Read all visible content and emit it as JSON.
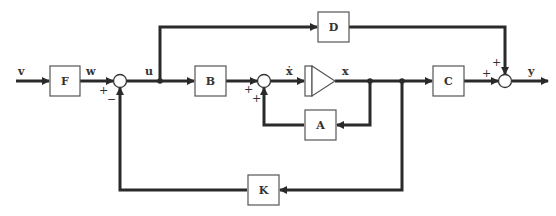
{
  "diagram": {
    "type": "control-system-block-diagram",
    "blocks": {
      "F": "F",
      "B": "B",
      "A": "A",
      "C": "C",
      "D": "D",
      "K": "K"
    },
    "signals": {
      "v": "v",
      "w": "w",
      "u": "u",
      "xdot": "ẋ",
      "x": "x",
      "y": "y"
    },
    "sum1_signs": {
      "w_in": "+",
      "feedback_in": "−"
    },
    "sum2_signs": {
      "b_in": "+",
      "a_in": "+"
    },
    "sum3_signs": {
      "c_in": "+",
      "d_in": "+"
    },
    "integrator": "integrator",
    "colors": {
      "line": "#2a2a2a",
      "block_border": "#555555",
      "text": "#333333"
    }
  }
}
